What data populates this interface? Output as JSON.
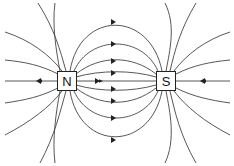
{
  "diagram": {
    "poles": [
      {
        "label": "N",
        "name": "north-pole"
      },
      {
        "label": "S",
        "name": "south-pole"
      }
    ],
    "line_color": "#333333",
    "arrow_direction": "from N to S"
  }
}
